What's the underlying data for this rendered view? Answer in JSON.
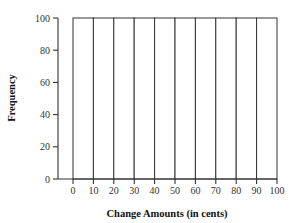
{
  "chart_data": {
    "type": "bar",
    "title": "",
    "xlabel": "Change Amounts (in cents)",
    "ylabel": "Frequency",
    "bin_edges": [
      0,
      10,
      20,
      30,
      40,
      50,
      60,
      70,
      80,
      90,
      100
    ],
    "categories": [
      "0-10",
      "10-20",
      "20-30",
      "30-40",
      "40-50",
      "50-60",
      "60-70",
      "70-80",
      "80-90",
      "90-100"
    ],
    "values": [
      100,
      100,
      100,
      100,
      100,
      100,
      100,
      100,
      100,
      100
    ],
    "x_tick_labels": [
      "0",
      "10",
      "20",
      "30",
      "40",
      "50",
      "60",
      "70",
      "80",
      "90",
      "100"
    ],
    "y_tick_labels": [
      "0",
      "20",
      "40",
      "60",
      "80",
      "100"
    ],
    "y_ticks": [
      0,
      20,
      40,
      60,
      80,
      100
    ],
    "ylim": [
      0,
      100
    ],
    "xlim": [
      0,
      100
    ],
    "grid": false,
    "legend": null,
    "histogram": true
  },
  "axes": {
    "x_title": "Change Amounts (in cents)",
    "y_title": "Frequency"
  }
}
